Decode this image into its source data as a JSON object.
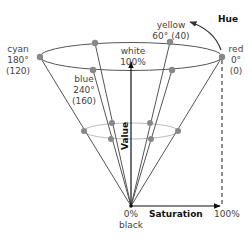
{
  "diagram": {
    "colors": {
      "line": "#555555",
      "inner_line": "#bbbbbb",
      "dot": "#888888",
      "axis": "#111111",
      "text": "#444444"
    },
    "hue_points": [
      {
        "name": "cyan",
        "angle": "180°",
        "scaled": "(120)"
      },
      {
        "name": "yellow",
        "angle": "60°",
        "scaled": "(40)"
      },
      {
        "name": "red",
        "angle": "0°",
        "scaled": "(0)"
      },
      {
        "name": "blue",
        "angle": "240°",
        "scaled": "(160)"
      }
    ],
    "labels": {
      "cyan_name": "cyan",
      "cyan_angle": "180°",
      "cyan_scaled": "(120)",
      "yellow_line": "yellow",
      "yellow_angle": "60° (40)",
      "red_name": "red",
      "red_angle": "0°",
      "red_scaled": "(0)",
      "blue_name": "blue",
      "blue_angle": "240°",
      "blue_scaled": "(160)",
      "white_name": "white",
      "white_value": "100%",
      "black_value": "0%",
      "black_name": "black",
      "saturation_max": "100%"
    },
    "axes": {
      "hue": "Hue",
      "value": "Value",
      "saturation": "Saturation"
    }
  }
}
